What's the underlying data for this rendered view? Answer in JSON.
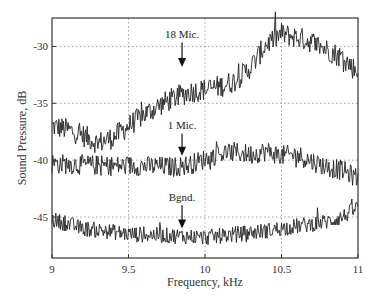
{
  "chart_data": {
    "type": "line",
    "title": "",
    "xlabel": "Frequency, kHz",
    "ylabel": "Sound Pressure, dB",
    "xlim": [
      9,
      11
    ],
    "ylim": [
      -48.6,
      -27.5
    ],
    "xticks": [
      9,
      9.5,
      10,
      10.5,
      11
    ],
    "xtick_labels": [
      "9",
      "9.5",
      "10",
      "10.5",
      "11"
    ],
    "yticks": [
      -30,
      -35,
      -40,
      -45
    ],
    "ytick_labels": [
      "-30",
      "-35",
      "-40",
      "-45"
    ],
    "grid": "dotted",
    "legend": null,
    "series": [
      {
        "name": "18 Mic.",
        "noise_db": 1.0,
        "x": [
          9.0,
          9.1,
          9.2,
          9.3,
          9.4,
          9.5,
          9.6,
          9.7,
          9.8,
          9.9,
          10.0,
          10.1,
          10.2,
          10.3,
          10.4,
          10.5,
          10.6,
          10.7,
          10.8,
          10.9,
          11.0
        ],
        "values": [
          -37.0,
          -37.3,
          -37.8,
          -38.5,
          -38.0,
          -37.0,
          -36.0,
          -35.2,
          -34.5,
          -34.0,
          -33.8,
          -33.5,
          -33.0,
          -31.8,
          -29.8,
          -28.9,
          -29.2,
          -29.6,
          -30.3,
          -31.0,
          -32.3
        ],
        "annotation": {
          "label": "18 Mic.",
          "x": 9.85,
          "label_db": -29.3,
          "arrow_tip_db": -31.8
        }
      },
      {
        "name": "1 Mic.",
        "noise_db": 0.9,
        "x": [
          9.0,
          9.2,
          9.4,
          9.6,
          9.8,
          9.9,
          10.0,
          10.1,
          10.2,
          10.3,
          10.4,
          10.5,
          10.6,
          10.7,
          10.8,
          10.9,
          11.0
        ],
        "values": [
          -40.3,
          -40.4,
          -40.5,
          -40.5,
          -40.6,
          -40.4,
          -39.9,
          -39.4,
          -39.3,
          -39.5,
          -39.2,
          -39.6,
          -39.5,
          -40.1,
          -40.6,
          -40.9,
          -41.6
        ],
        "annotation": {
          "label": "1 Mic.",
          "x": 9.85,
          "label_db": -37.3,
          "arrow_tip_db": -39.6
        }
      },
      {
        "name": "Bgnd.",
        "noise_db": 0.7,
        "x": [
          9.0,
          9.1,
          9.2,
          9.4,
          9.5,
          9.7,
          9.9,
          10.0,
          10.2,
          10.4,
          10.6,
          10.8,
          10.9,
          11.0
        ],
        "values": [
          -45.2,
          -45.6,
          -46.0,
          -46.3,
          -46.5,
          -46.6,
          -46.7,
          -46.8,
          -46.5,
          -46.2,
          -45.8,
          -45.4,
          -45.0,
          -44.1
        ],
        "annotation": {
          "label": "Bgnd.",
          "x": 9.85,
          "label_db": -43.6,
          "arrow_tip_db": -46.0
        }
      }
    ]
  },
  "layout": {
    "plot_left": 52,
    "plot_right": 358,
    "plot_top": 18,
    "plot_bottom": 258,
    "line_color": "#222222",
    "grid_color": "#888888",
    "frame_color": "#333333"
  }
}
